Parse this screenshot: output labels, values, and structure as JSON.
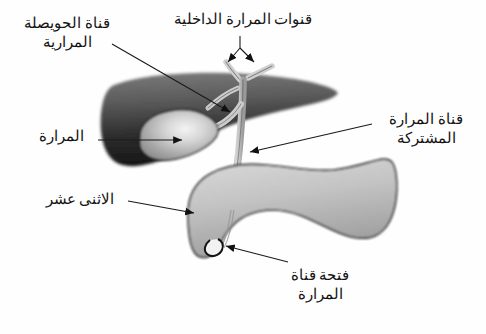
{
  "diagram": {
    "language": "ar",
    "background_color": "#fefefe",
    "labels": {
      "cystic_duct": {
        "line1": "قناة الحويصلة",
        "line2": "المرارية"
      },
      "gallbladder": {
        "line1": "المرارة"
      },
      "intrahepatic_ducts": {
        "line1": "قنوات المرارة الداخلية"
      },
      "common_bile_duct": {
        "line1": "قناة المرارة",
        "line2": "المشتركة"
      },
      "duodenum": {
        "line1": "الاثنى عشر"
      },
      "duct_opening": {
        "line1": "فتحة قناة",
        "line2": "المرارة"
      }
    },
    "structures": {
      "liver": {
        "name": "liver",
        "fill_dark": "#1b1b1b",
        "fill_light": "#6f6f6f"
      },
      "gallbladder": {
        "name": "gallbladder",
        "fill_dark": "#8d8d8d",
        "fill_light": "#e8e8e8"
      },
      "bile_ducts": {
        "name": "bile-ducts",
        "fill": "#c9c9c9",
        "stroke": "#4a4a4a"
      },
      "duodenum": {
        "name": "duodenum",
        "fill_dark": "#9a9a9a",
        "fill_light": "#d8d8d8",
        "stroke": "#1a1a1a"
      }
    },
    "leader_line_color": "#1a1a1a"
  }
}
